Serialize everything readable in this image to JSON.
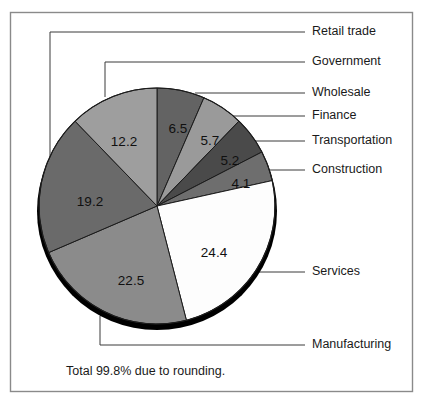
{
  "figure": {
    "name": "employment-share-pie-chart",
    "footnote": "Total 99.8% due to rounding.",
    "frame": {
      "border_color": "#8a8a8a"
    }
  },
  "chart_data": {
    "type": "pie",
    "title": "",
    "xlabel": "",
    "ylabel": "",
    "units": "percent",
    "total_label": "Total 99.8% due to rounding.",
    "total": 99.8,
    "start_angle_deg": 0,
    "direction": "clockwise",
    "legend": "callout-labels",
    "categories": [
      "Government",
      "Wholesale",
      "Finance",
      "Transportation",
      "Services",
      "Manufacturing",
      "Construction",
      "Retail trade"
    ],
    "values": [
      6.5,
      5.7,
      5.2,
      4.1,
      24.4,
      22.5,
      19.2,
      12.2
    ],
    "slices": [
      {
        "label": "Government",
        "value": 6.5,
        "value_text": "6.5",
        "color": "#636363"
      },
      {
        "label": "Wholesale",
        "value": 5.7,
        "value_text": "5.7",
        "color": "#9a9a9a"
      },
      {
        "label": "Finance",
        "value": 5.2,
        "value_text": "5.2",
        "color": "#4a4a4a"
      },
      {
        "label": "Transportation",
        "value": 4.1,
        "value_text": "4.1",
        "color": "#6e6e6e"
      },
      {
        "label": "Services",
        "value": 24.4,
        "value_text": "24.4",
        "color": "#fdfdfd"
      },
      {
        "label": "Manufacturing",
        "value": 22.5,
        "value_text": "22.5",
        "color": "#8b8b8b"
      },
      {
        "label": "Construction",
        "value": 19.2,
        "value_text": "19.2",
        "color": "#6a6a6a"
      },
      {
        "label": "Retail trade",
        "value": 12.2,
        "value_text": "12.2",
        "color": "#9e9e9e"
      }
    ]
  },
  "callouts": [
    {
      "label": "Retail trade",
      "text_x": 312,
      "text_y": 32
    },
    {
      "label": "Government",
      "text_x": 312,
      "text_y": 62
    },
    {
      "label": "Wholesale",
      "text_x": 312,
      "text_y": 93
    },
    {
      "label": "Finance",
      "text_x": 312,
      "text_y": 116
    },
    {
      "label": "Transportation",
      "text_x": 312,
      "text_y": 141
    },
    {
      "label": "Construction",
      "text_x": 312,
      "text_y": 170
    },
    {
      "label": "Services",
      "text_x": 312,
      "text_y": 272
    },
    {
      "label": "Manufacturing",
      "text_x": 312,
      "text_y": 345
    }
  ],
  "value_labels": [
    {
      "text": "6.5",
      "x": 178,
      "y": 129
    },
    {
      "text": "5.7",
      "x": 210,
      "y": 141
    },
    {
      "text": "5.2",
      "x": 230,
      "y": 161
    },
    {
      "text": "4.1",
      "x": 241,
      "y": 184
    },
    {
      "text": "24.4",
      "x": 214,
      "y": 253
    },
    {
      "text": "22.5",
      "x": 131,
      "y": 281
    },
    {
      "text": "19.2",
      "x": 90,
      "y": 202
    },
    {
      "text": "12.2",
      "x": 124,
      "y": 142
    }
  ]
}
